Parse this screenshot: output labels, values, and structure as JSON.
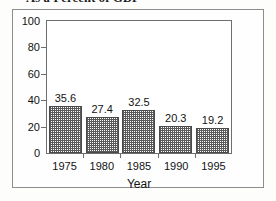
{
  "chart_data": {
    "type": "bar",
    "title": "As a Percent of GDP",
    "xlabel": "Year",
    "ylabel": "",
    "categories": [
      "1975",
      "1980",
      "1985",
      "1990",
      "1995"
    ],
    "values": [
      35.6,
      27.4,
      32.5,
      20.3,
      19.2
    ],
    "data_labels": [
      "35.6",
      "27.4",
      "32.5",
      "20.3",
      "19.2"
    ],
    "ylim": [
      0,
      100
    ],
    "yticks": [
      0,
      20,
      40,
      60,
      80,
      100
    ],
    "ytick_labels": [
      "0",
      "20",
      "40",
      "60",
      "80",
      "100"
    ],
    "grid": false,
    "legend": null,
    "bar_fill": "grey-stipple-pattern",
    "colors": {
      "axis": "#6e6e6e",
      "bar_edge": "#4a4a4a",
      "bar_pattern": "#5a5a5a",
      "text": "#121212",
      "page_border": "#8d8d8d",
      "background": "#ffffff"
    }
  }
}
